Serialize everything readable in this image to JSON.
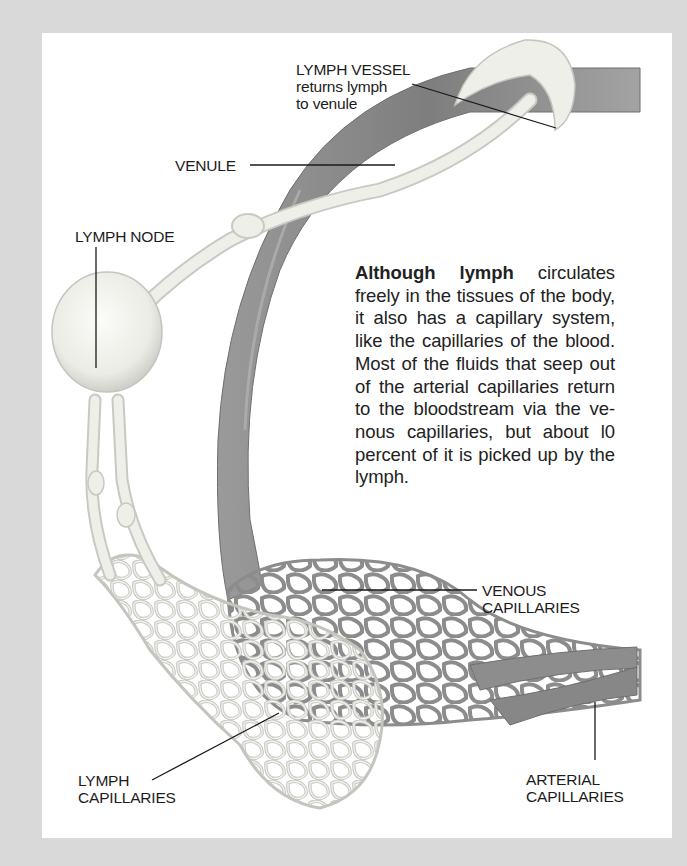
{
  "figure": {
    "type": "anatomical-illustration",
    "colors": {
      "background": "#d9d9d9",
      "panel": "#ffffff",
      "blood_vessel": "#8a8a8a",
      "lymph_vessel": "#e8e8e4",
      "leader_line": "#1a1a1a"
    }
  },
  "labels": {
    "lymph_vessel_title": "LYMPH VESSEL",
    "lymph_vessel_line2": "returns lymph",
    "lymph_vessel_line3": "to venule",
    "venule": "VENULE",
    "lymph_node": "LYMPH NODE",
    "venous_capillaries_line1": "VENOUS",
    "venous_capillaries_line2": "CAPILLARIES",
    "lymph_capillaries_line1": "LYMPH",
    "lymph_capillaries_line2": "CAPILLARIES",
    "arterial_capillaries_line1": "ARTERIAL",
    "arterial_capillaries_line2": "CAPILLARIES"
  },
  "caption": {
    "lead": "Although lymph",
    "body": " circulates freely in the tissues of the body, it also has a capillary system, like the capillaries of the blood. Most of the fluids that seep out of the arterial capillaries return to the bloodstream via the ve-nous capillaries, but about l0 percent of it is picked up by the lymph."
  }
}
